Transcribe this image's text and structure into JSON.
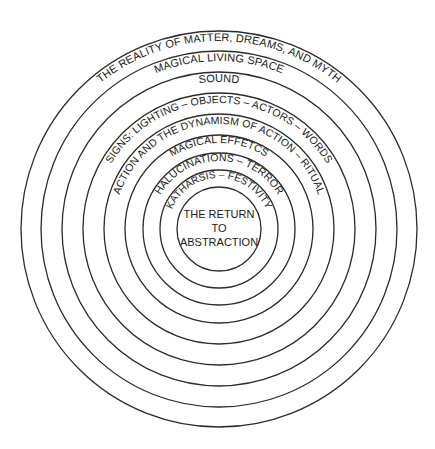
{
  "diagram": {
    "type": "concentric-circles",
    "center": {
      "x": 219,
      "y": 229
    },
    "stroke_color": "#2b2b2b",
    "text_color": "#1a1a1a",
    "rings": [
      {
        "radius": 198
      },
      {
        "radius": 178
      },
      {
        "radius": 157
      },
      {
        "radius": 136
      },
      {
        "radius": 115
      },
      {
        "radius": 94
      },
      {
        "radius": 76
      },
      {
        "radius": 59
      },
      {
        "radius": 42
      }
    ],
    "layers": [
      {
        "label": "THE REALITY OF MATTER, DREAMS, AND MYTH"
      },
      {
        "label": "MAGICAL LIVING SPACE"
      },
      {
        "label": "SOUND"
      },
      {
        "label": "SIGNS: LIGHTING – OBJECTS – ACTORS – WORDS"
      },
      {
        "label": "ACTION AND THE DYNAMISM OF ACTION – RITUAL"
      },
      {
        "label": "MAGICAL EFFETCS"
      },
      {
        "label": "HALUCINATIONS – TERROR"
      },
      {
        "label": "KATHARSIS – FESTIVITY"
      }
    ],
    "center_label": {
      "line1": "THE RETURN",
      "line2": "TO",
      "line3": "ABSTRACTION"
    }
  }
}
